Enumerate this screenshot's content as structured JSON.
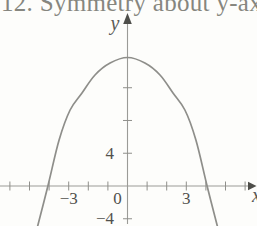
{
  "caption": {
    "text": "12. Symmetry about y-axis"
  },
  "figure": {
    "colors": {
      "background": "#fdfdfb",
      "axis": "#9b9b97",
      "tick": "#8f8f8b",
      "curve": "#8e8e8a",
      "arrow": "#4e4e4a",
      "tick_label": "#51514d",
      "axis_letter": "#5a5a56",
      "caption": "#86867f"
    }
  },
  "chart_data": {
    "type": "line",
    "title": "12. Symmetry about y-axis",
    "xlabel": "x",
    "ylabel": "y",
    "curve_description": "downward-opening parabola symmetric about the y-axis",
    "vertex": [
      0,
      16
    ],
    "x_intercepts": [
      -4,
      4
    ],
    "series": [
      {
        "name": "parabola",
        "x": [
          -4.62,
          -4.06,
          -3.49,
          -2.93,
          -2.32,
          -1.66,
          -0.89,
          0,
          0.89,
          1.66,
          2.32,
          2.93,
          3.49,
          4.06,
          4.62
        ],
        "y": [
          -5.25,
          0,
          5.62,
          9.28,
          11.36,
          13.55,
          15.02,
          15.69,
          15.02,
          13.55,
          11.36,
          9.28,
          5.62,
          0,
          -5.25
        ]
      }
    ],
    "x_ticks": [
      -6,
      -5,
      -4,
      -3,
      -2,
      -1,
      1,
      2,
      3,
      4,
      5,
      6
    ],
    "y_ticks": [
      4,
      8,
      12,
      -4
    ],
    "x_tick_label_items": [
      {
        "x": -3,
        "text": "−3",
        "dx": 0
      },
      {
        "x": 0,
        "text": "0",
        "dx": -10
      },
      {
        "x": 3,
        "text": "3",
        "dx": 0
      }
    ],
    "y_tick_label_items": [
      {
        "y": 4,
        "text": "4"
      },
      {
        "y": -4,
        "text": "−4"
      }
    ],
    "xlim": [
      -6.5,
      6.6
    ],
    "ylim": [
      -4.9,
      20.5
    ],
    "grid": false,
    "legend": null
  }
}
